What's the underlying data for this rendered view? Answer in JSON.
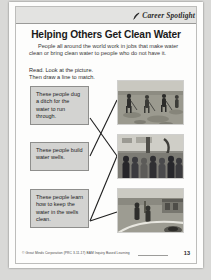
{
  "page": {
    "header_label": "Career Spotlight",
    "header_icon": "quill-icon",
    "title": "Helping Others Get Clean Water",
    "intro": "People all around the world work in jobs that make water clean or bring clean water to people who do not have it.",
    "directions_line1": "Read. Look at the picture.",
    "directions_line2": "Then draw a line to match."
  },
  "prompts": [
    {
      "text": "These people dug a ditch for the water to run through."
    },
    {
      "text": "These people build water wells."
    },
    {
      "text": "These people learn how to keep the water in the wells clean."
    }
  ],
  "photos": [
    {
      "caption": "workers digging a ditch in a field"
    },
    {
      "caption": "a crowd of people gathered around a water pump"
    },
    {
      "caption": "people standing near a well by a roadside"
    }
  ],
  "footer": {
    "credit": "© Great Minds Corporation (PRC 3-11-17) BAM Inquiry Based Learning",
    "page_number": "13"
  },
  "colors": {
    "page_background": "#fdfdfc",
    "header_band": "#e3e3e1",
    "prompt_box_fill": "#d3d3d1",
    "prompt_box_border": "#8e8e8c",
    "line_color": "#1f1f1f"
  }
}
